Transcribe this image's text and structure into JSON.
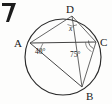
{
  "figure": {
    "shape": "circle",
    "vertices": [
      {
        "id": "A",
        "label": "A",
        "x": 30,
        "y": 43
      },
      {
        "id": "B",
        "label": "B",
        "x": 82,
        "y": 87
      },
      {
        "id": "C",
        "label": "C",
        "x": 96,
        "y": 42
      },
      {
        "id": "D",
        "label": "D",
        "x": 72,
        "y": 16
      }
    ],
    "vertex_label_positions": [
      {
        "id": "A",
        "label": "A",
        "x": 14,
        "y": 47
      },
      {
        "id": "B",
        "label": "B",
        "x": 88,
        "y": 99
      },
      {
        "id": "C",
        "label": "C",
        "x": 100,
        "y": 46
      },
      {
        "id": "D",
        "label": "D",
        "x": 68,
        "y": 13
      }
    ],
    "angles": [
      {
        "id": "angle-at-A",
        "vertex": "A",
        "label": "40°",
        "value": 40,
        "unit": "degrees",
        "label_x": 36,
        "label_y": 53
      },
      {
        "id": "angle-at-C",
        "vertex": "C",
        "label": "75°",
        "value": 75,
        "unit": "degrees",
        "label_x": 72,
        "label_y": 56
      },
      {
        "id": "angle-at-D",
        "vertex": "D",
        "label": "x",
        "value": null,
        "unit": "unknown",
        "label_x": 68,
        "label_y": 30
      }
    ],
    "circle": {
      "center_x": 63,
      "center_y": 57,
      "radius": 38
    },
    "chords": [
      {
        "id": "chord-AC",
        "from": "A",
        "to": "C"
      },
      {
        "id": "chord-AD",
        "from": "A",
        "to": "D"
      },
      {
        "id": "chord-DC",
        "from": "D",
        "to": "C"
      },
      {
        "id": "chord-AB",
        "from": "A",
        "to": "B"
      },
      {
        "id": "chord-BC",
        "from": "B",
        "to": "C"
      },
      {
        "id": "chord-DB",
        "from": "D",
        "to": "B"
      }
    ],
    "colors": {
      "circle_stroke": "#2b2b2b",
      "chord_stroke": "#4a4a4a",
      "label_fill": "#1a1a1a",
      "background": "#fdfdfc"
    },
    "corner_mark": {
      "id": "page-corner-mark",
      "description": "partial dark glyph at top-left edge"
    }
  }
}
